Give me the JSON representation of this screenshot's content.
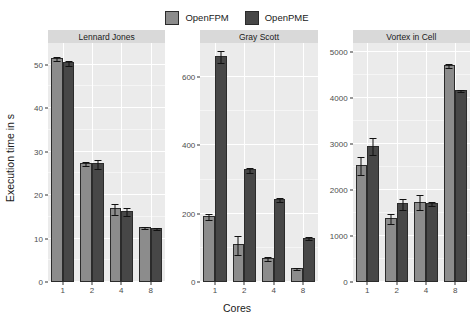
{
  "chart_data": {
    "type": "bar",
    "title": "",
    "xlabel": "Cores",
    "ylabel": "Execution time in s",
    "categories": [
      "1",
      "2",
      "4",
      "8"
    ],
    "legend": {
      "position": "top",
      "entries": [
        {
          "name": "OpenFPM",
          "color": "#8c8c8c"
        },
        {
          "name": "OpenPME",
          "color": "#474747"
        }
      ]
    },
    "grid": true,
    "facet_variable": "benchmark",
    "facets": [
      {
        "label": "Lennard Jones",
        "ylim": [
          0,
          55
        ],
        "yticks": [
          0,
          10,
          20,
          30,
          40,
          50
        ],
        "ytick_labels": [
          "0",
          "10",
          "20",
          "30",
          "40",
          "50"
        ],
        "series": [
          {
            "name": "OpenFPM",
            "values": [
              51.5,
              27.4,
              17.0,
              12.7
            ],
            "errors": [
              0.5,
              0.4,
              1.3,
              0.3
            ]
          },
          {
            "name": "OpenPME",
            "values": [
              50.6,
              27.3,
              16.3,
              12.4
            ],
            "errors": [
              0.6,
              1.1,
              0.9,
              0.2
            ]
          }
        ]
      },
      {
        "label": "Gray Scott",
        "ylim": [
          0,
          700
        ],
        "yticks": [
          0,
          200,
          400,
          600
        ],
        "ytick_labels": [
          "0",
          "200",
          "400",
          "600"
        ],
        "series": [
          {
            "name": "OpenFPM",
            "values": [
              193,
              110,
              70,
              40
            ],
            "errors": [
              8,
              28,
              5,
              3
            ]
          },
          {
            "name": "OpenPME",
            "values": [
              663,
              330,
              243,
              130
            ],
            "errors": [
              18,
              8,
              6,
              5
            ]
          }
        ]
      },
      {
        "label": "Vortex in Cell",
        "ylim": [
          0,
          5200
        ],
        "yticks": [
          0,
          1000,
          2000,
          3000,
          4000,
          5000
        ],
        "ytick_labels": [
          "0",
          "1000",
          "2000",
          "3000",
          "4000",
          "5000"
        ],
        "series": [
          {
            "name": "OpenFPM",
            "values": [
              2550,
              1390,
              1750,
              4720
            ],
            "errors": [
              200,
              120,
              160,
              50
            ]
          },
          {
            "name": "OpenPME",
            "values": [
              2970,
              1710,
              1720,
              4180
            ],
            "errors": [
              180,
              130,
              40,
              30
            ]
          }
        ]
      }
    ]
  },
  "axes": {
    "ylabel": "Execution time in s",
    "xlabel": "Cores"
  },
  "legend": {
    "fpm_label": "OpenFPM",
    "pme_label": "OpenPME"
  },
  "facet_titles": {
    "f0": "Lennard Jones",
    "f1": "Gray Scott",
    "f2": "Vortex in Cell"
  }
}
